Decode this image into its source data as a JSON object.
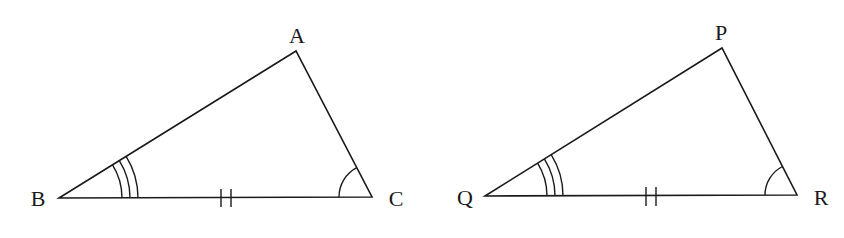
{
  "diagram": {
    "colors": {
      "stroke": "#1a1a1a",
      "background": "#ffffff"
    },
    "triangles": [
      {
        "name": "ABC",
        "vertices": {
          "A": {
            "label": "A",
            "x": 296,
            "y": 51,
            "lx": 297,
            "ly": 43
          },
          "B": {
            "label": "B",
            "x": 59,
            "y": 198,
            "lx": 38,
            "ly": 206
          },
          "C": {
            "label": "C",
            "x": 372,
            "y": 197,
            "lx": 396,
            "ly": 206
          }
        },
        "marks": {
          "angle_B": {
            "type": "triple-arc",
            "radii": [
              63,
              71,
              79
            ]
          },
          "angle_C": {
            "type": "single-arc",
            "radius": 33
          },
          "side_BC": {
            "type": "double-tick",
            "xs": [
              221,
              231
            ],
            "y1": 189,
            "y2": 207
          }
        }
      },
      {
        "name": "PQR",
        "vertices": {
          "P": {
            "label": "P",
            "x": 722,
            "y": 48,
            "lx": 721,
            "ly": 40
          },
          "Q": {
            "label": "Q",
            "x": 485,
            "y": 196,
            "lx": 465,
            "ly": 205
          },
          "R": {
            "label": "R",
            "x": 797,
            "y": 195,
            "lx": 821,
            "ly": 205
          }
        },
        "marks": {
          "angle_Q": {
            "type": "triple-arc",
            "radii": [
              62,
              70,
              78
            ]
          },
          "angle_R": {
            "type": "single-arc",
            "radius": 32
          },
          "side_QR": {
            "type": "double-tick",
            "xs": [
              646,
              656
            ],
            "y1": 187,
            "y2": 206
          }
        }
      }
    ]
  }
}
